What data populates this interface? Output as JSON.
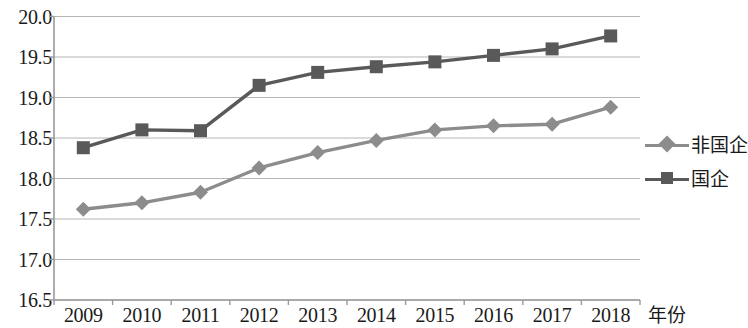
{
  "chart_data": {
    "type": "line",
    "title": "",
    "xlabel": "年份",
    "ylabel": "",
    "categories": [
      "2009",
      "2010",
      "2011",
      "2012",
      "2013",
      "2014",
      "2015",
      "2016",
      "2017",
      "2018"
    ],
    "ylim": [
      16.5,
      20.0
    ],
    "ytick_labels": [
      "20.0",
      "19.5",
      "19.0",
      "18.5",
      "18.0",
      "17.5",
      "17.0",
      "16.5"
    ],
    "ytick_values": [
      20.0,
      19.5,
      19.0,
      18.5,
      18.0,
      17.5,
      17.0,
      16.5
    ],
    "grid": true,
    "legend_position": "right",
    "series": [
      {
        "name": "非国企",
        "marker": "diamond",
        "color": "#8c8c8c",
        "values": [
          17.62,
          17.7,
          17.83,
          18.13,
          18.32,
          18.47,
          18.6,
          18.65,
          18.67,
          18.88
        ]
      },
      {
        "name": "国企",
        "marker": "square",
        "color": "#595959",
        "values": [
          18.38,
          18.6,
          18.59,
          19.15,
          19.31,
          19.38,
          19.44,
          19.52,
          19.6,
          19.76
        ]
      }
    ]
  },
  "legend": {
    "items": [
      {
        "label": "非国企",
        "marker": "diamond-marker",
        "color": "#8c8c8c"
      },
      {
        "label": "国企",
        "marker": "square-marker",
        "color": "#595959"
      }
    ]
  },
  "axis": {
    "x_title": "年份"
  }
}
